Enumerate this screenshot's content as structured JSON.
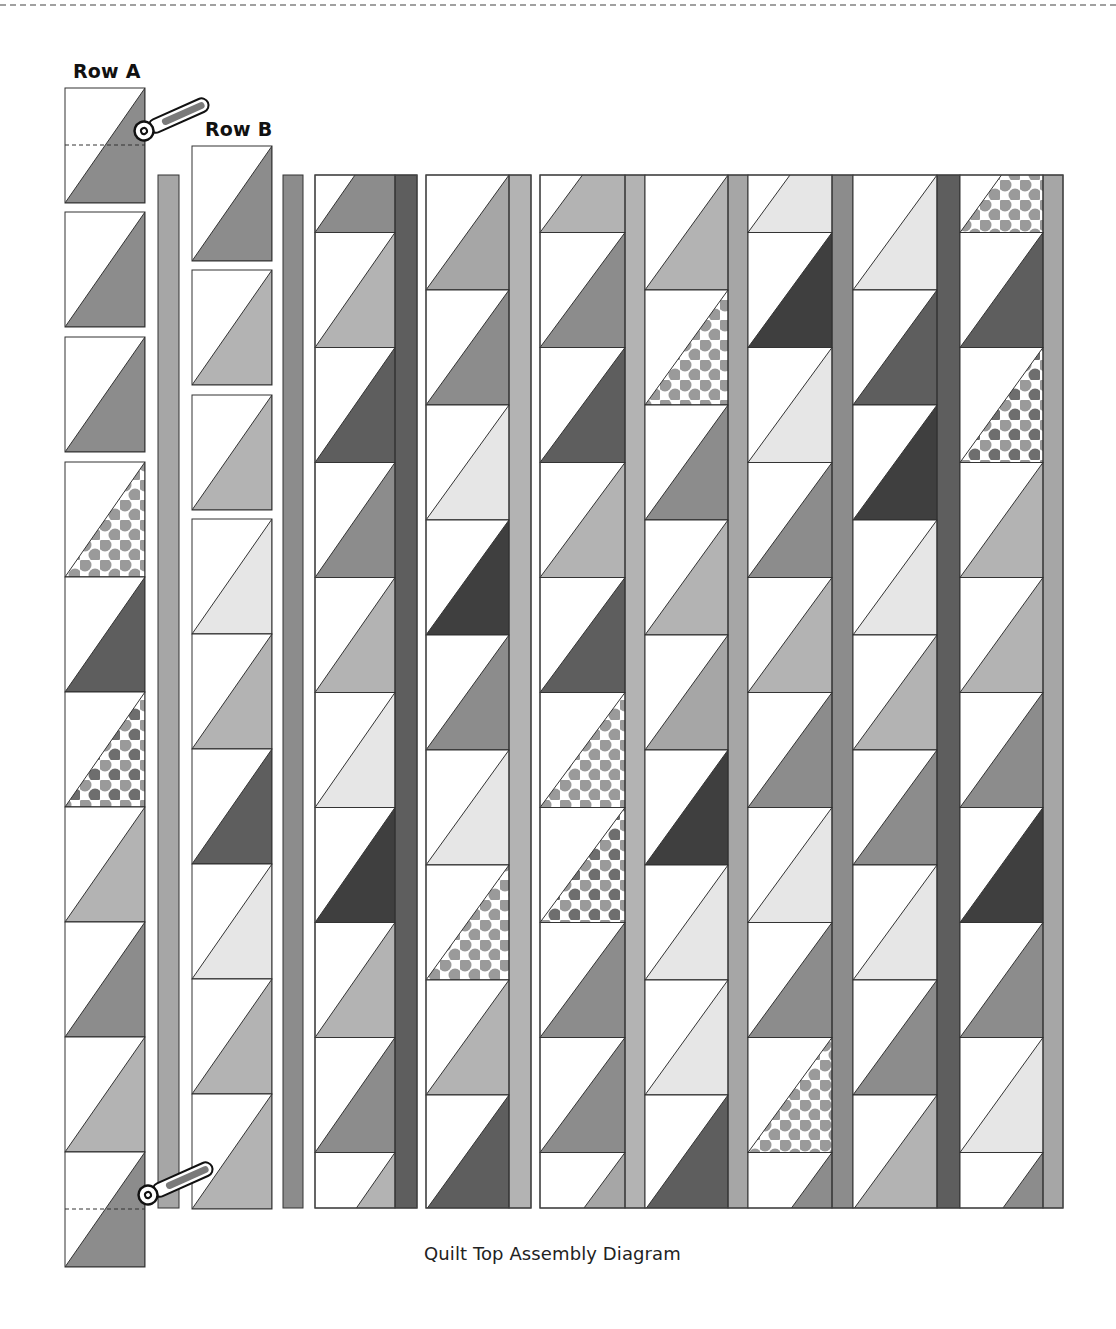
{
  "labels": {
    "row_a": "Row A",
    "row_b": "Row B",
    "caption": "Quilt Top Assembly Diagram"
  },
  "fabrics": {
    "white": "#ffffff",
    "light": "#e6e6e6",
    "midlight": "#b3b3b3",
    "mid": "#a6a6a6",
    "middark": "#8c8c8c",
    "dark": "#5e5e5e",
    "darkest": "#3f3f3f",
    "dots_bg": "#ffffff",
    "dots_fg": "#9a9a9a",
    "dotsdark_fg": "#6e6e6e",
    "outline": "#333333"
  },
  "block_height": 115,
  "row_a": {
    "x": 65,
    "width": 80,
    "separate_blocks": [
      {
        "y": 88,
        "fabric": "middark",
        "cut_line_y": 145
      },
      {
        "y": 212,
        "fabric": "middark"
      },
      {
        "y": 337,
        "fabric": "middark"
      }
    ],
    "strip": {
      "y": 462,
      "fabrics": [
        "dots",
        "dark",
        "dotsdark",
        "midlight",
        "middark",
        "midlight",
        "middark"
      ],
      "cut_line_y": 1209
    }
  },
  "row_b": {
    "x": 192,
    "width": 80,
    "separate_blocks": [
      {
        "y": 146,
        "fabric": "middark"
      },
      {
        "y": 270,
        "fabric": "midlight"
      },
      {
        "y": 395,
        "fabric": "midlight"
      }
    ],
    "strip": {
      "y": 519,
      "fabrics": [
        "light",
        "midlight",
        "dark",
        "light",
        "midlight",
        "midlight"
      ]
    }
  },
  "sashing": [
    {
      "x": 158,
      "width": 21,
      "top": 175,
      "bottom": 1208,
      "fabric": "mid"
    },
    {
      "x": 283,
      "width": 20,
      "top": 175,
      "bottom": 1208,
      "fabric": "middark"
    },
    {
      "x": 395,
      "width": 22,
      "top": 175,
      "bottom": 1208,
      "fabric": "dark"
    },
    {
      "x": 509,
      "width": 22,
      "top": 175,
      "bottom": 1208,
      "fabric": "midlight"
    },
    {
      "x": 625,
      "width": 20,
      "top": 175,
      "bottom": 1208,
      "fabric": "midlight"
    },
    {
      "x": 728,
      "width": 20,
      "top": 175,
      "bottom": 1208,
      "fabric": "mid"
    },
    {
      "x": 832,
      "width": 21,
      "top": 175,
      "bottom": 1208,
      "fabric": "middark"
    },
    {
      "x": 937,
      "width": 23,
      "top": 175,
      "bottom": 1208,
      "fabric": "dark"
    },
    {
      "x": 1043,
      "width": 20,
      "top": 175,
      "bottom": 1208,
      "fabric": "mid"
    }
  ],
  "columns": [
    {
      "x": 315,
      "width": 80,
      "offset": true,
      "fabrics": [
        "middark",
        "midlight",
        "dark",
        "middark",
        "midlight",
        "light",
        "darkest",
        "midlight",
        "middark",
        "midlight"
      ]
    },
    {
      "x": 426,
      "width": 83,
      "offset": false,
      "fabrics": [
        "mid",
        "middark",
        "light",
        "darkest",
        "middark",
        "light",
        "dots",
        "midlight",
        "dark"
      ]
    },
    {
      "x": 540,
      "width": 85,
      "offset": true,
      "fabrics": [
        "midlight",
        "middark",
        "dark",
        "midlight",
        "dark",
        "dots",
        "dotsdark",
        "middark",
        "middark",
        "mid"
      ]
    },
    {
      "x": 645,
      "width": 83,
      "offset": false,
      "fabrics": [
        "midlight",
        "dots",
        "middark",
        "midlight",
        "mid",
        "darkest",
        "light",
        "light",
        "dark"
      ]
    },
    {
      "x": 748,
      "width": 84,
      "offset": true,
      "fabrics": [
        "light",
        "darkest",
        "light",
        "middark",
        "midlight",
        "middark",
        "light",
        "middark",
        "dots",
        "middark"
      ]
    },
    {
      "x": 853,
      "width": 84,
      "offset": false,
      "fabrics": [
        "light",
        "dark",
        "darkest",
        "light",
        "midlight",
        "middark",
        "light",
        "middark",
        "midlight"
      ]
    },
    {
      "x": 960,
      "width": 83,
      "offset": true,
      "fabrics": [
        "dots",
        "dark",
        "dotsdark",
        "midlight",
        "midlight",
        "middark",
        "darkest",
        "middark",
        "light",
        "middark"
      ]
    }
  ],
  "group_outlines": [
    {
      "x": 315,
      "width": 102
    },
    {
      "x": 426,
      "width": 105
    },
    {
      "x": 540,
      "width": 523
    }
  ],
  "cutters": [
    {
      "name": "rotary-cutter-top",
      "x": 144,
      "y": 131
    },
    {
      "name": "rotary-cutter-bottom",
      "x": 148,
      "y": 1195
    }
  ]
}
